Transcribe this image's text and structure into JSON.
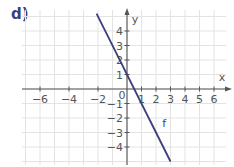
{
  "exercise_label": "d)",
  "chart_data": {
    "type": "line",
    "title": "",
    "xlabel": "x",
    "ylabel": "y",
    "xlim": [
      -7.2,
      7
    ],
    "ylim": [
      -5.2,
      5.5
    ],
    "grid": true,
    "x_ticks": [
      -6,
      -4,
      -2,
      0,
      1,
      2,
      3,
      4,
      5,
      6
    ],
    "x_tick_labels": [
      "−6",
      "−4",
      "−2",
      "0",
      "1",
      "2",
      "3",
      "4",
      "5",
      "6"
    ],
    "y_ticks": [
      -4,
      -3,
      -2,
      -1,
      1,
      2,
      3,
      4
    ],
    "y_tick_labels": [
      "−4",
      "−3",
      "−2",
      "−1",
      "1",
      "2",
      "3",
      "4"
    ],
    "series": [
      {
        "name": "f",
        "equation": "f(x) = -2x + 1",
        "slope": -2,
        "intercept": 1,
        "x": [
          -2.1,
          3
        ],
        "y": [
          5.2,
          -5
        ],
        "color": "#3b3f7a"
      }
    ],
    "legend": "inline label 'f' near line at x≈2.5"
  },
  "colors": {
    "line": "#3b3f7a",
    "grid": "#e3e3e3",
    "axis": "#555555",
    "label": "#3b3f7a"
  }
}
